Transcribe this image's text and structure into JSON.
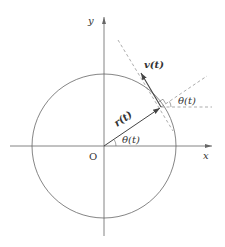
{
  "diagram": {
    "type": "circular-motion",
    "labels": {
      "x_axis": "x",
      "y_axis": "y",
      "origin": "O",
      "position_vector": "r(t)",
      "velocity_vector": "v(t)",
      "angle_at_origin": "θ(t)",
      "angle_at_point": "θ(t)"
    },
    "colors": {
      "stroke": "#555555",
      "dashed": "#888888",
      "text": "#333333"
    }
  }
}
